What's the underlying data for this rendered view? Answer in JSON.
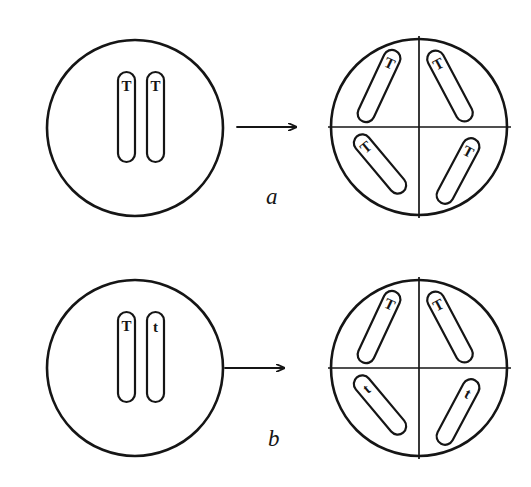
{
  "figure": {
    "background_color": "#ffffff",
    "ink_color": "#151515",
    "width": 531,
    "height": 487
  },
  "panels": [
    {
      "id": "a",
      "label": "a",
      "label_position": {
        "x": 266,
        "y": 184
      },
      "description": "Homozygous cell dividing into four cells",
      "parent_cell": {
        "name": "parent-cell-a",
        "center": {
          "x": 135,
          "y": 128
        },
        "radius": 88,
        "chromosomes": [
          {
            "id": "a-p-1",
            "allele": "T",
            "x": 118,
            "y": 72,
            "length": 90,
            "width": 17,
            "angle": 0
          },
          {
            "id": "a-p-2",
            "allele": "T",
            "x": 147,
            "y": 72,
            "length": 90,
            "width": 17,
            "angle": 0
          }
        ]
      },
      "daughter_cell": {
        "name": "daughter-cell-a",
        "center": {
          "x": 419,
          "y": 127
        },
        "radius": 88,
        "quadrants": [
          "top-left",
          "top-right",
          "bottom-left",
          "bottom-right"
        ],
        "chromosomes": [
          {
            "id": "a-d-1",
            "allele": "T",
            "quadrant": "top-left",
            "cx": 379,
            "cy": 86,
            "length": 78,
            "width": 17,
            "angle": 25
          },
          {
            "id": "a-d-2",
            "allele": "T",
            "quadrant": "top-right",
            "cx": 450,
            "cy": 86,
            "length": 78,
            "width": 17,
            "angle": -28
          },
          {
            "id": "a-d-3",
            "allele": "T",
            "quadrant": "bottom-left",
            "cx": 380,
            "cy": 164,
            "length": 72,
            "width": 17,
            "angle": -40
          },
          {
            "id": "a-d-4",
            "allele": "T",
            "quadrant": "bottom-right",
            "cx": 458,
            "cy": 171,
            "length": 72,
            "width": 17,
            "angle": 28
          }
        ]
      },
      "arrow": {
        "name": "arrow-a",
        "x1": 237,
        "y1": 127,
        "x2": 297,
        "y2": 127
      }
    },
    {
      "id": "b",
      "label": "b",
      "label_position": {
        "x": 268,
        "y": 426
      },
      "description": "Heterozygous cell dividing into four cells",
      "parent_cell": {
        "name": "parent-cell-b",
        "center": {
          "x": 135,
          "y": 368
        },
        "radius": 88,
        "chromosomes": [
          {
            "id": "b-p-1",
            "allele": "T",
            "x": 118,
            "y": 312,
            "length": 90,
            "width": 17,
            "angle": 0
          },
          {
            "id": "b-p-2",
            "allele": "t",
            "x": 147,
            "y": 312,
            "length": 90,
            "width": 17,
            "angle": 0
          }
        ]
      },
      "daughter_cell": {
        "name": "daughter-cell-b",
        "center": {
          "x": 419,
          "y": 368
        },
        "radius": 88,
        "quadrants": [
          "top-left",
          "top-right",
          "bottom-left",
          "bottom-right"
        ],
        "chromosomes": [
          {
            "id": "b-d-1",
            "allele": "T",
            "quadrant": "top-left",
            "cx": 379,
            "cy": 327,
            "length": 78,
            "width": 17,
            "angle": 25
          },
          {
            "id": "b-d-2",
            "allele": "T",
            "quadrant": "top-right",
            "cx": 450,
            "cy": 327,
            "length": 78,
            "width": 17,
            "angle": -28
          },
          {
            "id": "b-d-3",
            "allele": "t",
            "quadrant": "bottom-left",
            "cx": 380,
            "cy": 405,
            "length": 72,
            "width": 17,
            "angle": -40
          },
          {
            "id": "b-d-4",
            "allele": "t",
            "quadrant": "bottom-right",
            "cx": 458,
            "cy": 412,
            "length": 72,
            "width": 17,
            "angle": 28
          }
        ]
      },
      "arrow": {
        "name": "arrow-b",
        "x1": 225,
        "y1": 368,
        "x2": 285,
        "y2": 368
      }
    }
  ]
}
